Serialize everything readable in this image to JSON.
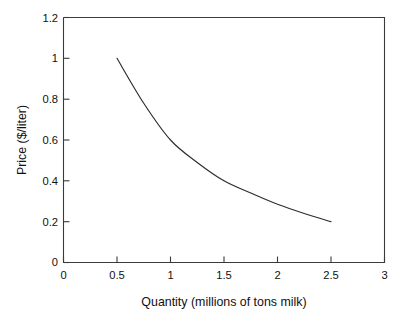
{
  "chart_data": {
    "type": "line",
    "title": "",
    "subtitle": "",
    "xlabel": "Quantity (millions of tons milk)",
    "ylabel": "Price ($/liter)",
    "xlim": [
      0,
      3
    ],
    "ylim": [
      0,
      1.2
    ],
    "xticks": [
      0,
      0.5,
      1,
      1.5,
      2,
      2.5,
      3
    ],
    "xtick_labels": [
      "0",
      "0.5",
      "1",
      "1.5",
      "2",
      "2.5",
      "3"
    ],
    "yticks": [
      0,
      0.2,
      0.4,
      0.6,
      0.8,
      1,
      1.2
    ],
    "ytick_labels": [
      "0",
      "0.2",
      "0.4",
      "0.6",
      "0.8",
      "1",
      "1.2"
    ],
    "grid": false,
    "legend": false,
    "legend_position": "none",
    "line_color": "#2e2e2e",
    "axis_color": "#3a3a3a",
    "background_color": "#ffffff",
    "annotations": [],
    "series": [
      {
        "name": "Demand curve",
        "x": [
          0.5,
          0.75,
          1.0,
          1.25,
          1.5,
          1.75,
          2.0,
          2.25,
          2.5
        ],
        "values": [
          1.0,
          0.78,
          0.6,
          0.49,
          0.4,
          0.34,
          0.285,
          0.24,
          0.2
        ]
      }
    ]
  },
  "axes": {
    "x_title": "Quantity (millions of tons milk)",
    "y_title": "Price ($/liter)",
    "x_labels": {
      "t0": "0",
      "t1": "0.5",
      "t2": "1",
      "t3": "1.5",
      "t4": "2",
      "t5": "2.5",
      "t6": "3"
    },
    "y_labels": {
      "t0": "0",
      "t1": "0.2",
      "t2": "0.4",
      "t3": "0.6",
      "t4": "0.8",
      "t5": "1",
      "t6": "1.2"
    }
  }
}
